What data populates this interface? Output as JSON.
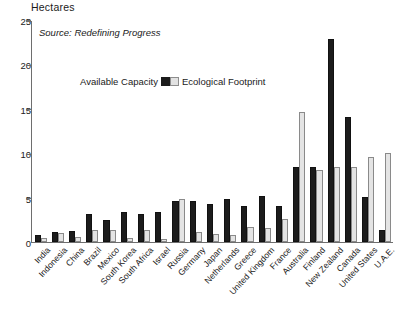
{
  "chart_data": {
    "type": "bar",
    "title": "",
    "subtitle": "",
    "ylabel": "Hectares",
    "xlabel": "",
    "source": "Source: Redefining Progress",
    "ylim": [
      0,
      25
    ],
    "yticks": [
      0,
      5,
      10,
      15,
      20,
      25
    ],
    "ytick_labels": [
      "0",
      "5",
      "10",
      "15",
      "20",
      "25"
    ],
    "grid": false,
    "legend_position": "inside-upper-left",
    "legend": [
      "Available Capacity",
      "Ecological Footprint"
    ],
    "categories": [
      "India",
      "Indonesia",
      "China",
      "Brazil",
      "Mexico",
      "South Korea",
      "South Africa",
      "Israel",
      "Russia",
      "Germany",
      "Japan",
      "Netherlands",
      "Greece",
      "United Kingdom",
      "France",
      "Australia",
      "Finland",
      "New Zealand",
      "Canada",
      "United States",
      "U.A.E."
    ],
    "series": [
      {
        "name": "Ecological Footprint",
        "color": "#1c1c1c",
        "values": [
          0.8,
          1.1,
          1.2,
          3.1,
          2.5,
          3.4,
          3.2,
          3.4,
          4.6,
          4.6,
          4.3,
          4.8,
          4.1,
          5.2,
          4.1,
          8.5,
          8.4,
          22.9,
          14.1,
          5.1,
          1.3
        ]
      },
      {
        "name": "Available Capacity",
        "color": "#e4e4e4",
        "values": [
          0.5,
          1.0,
          0.6,
          1.3,
          1.3,
          0.5,
          1.3,
          0.3,
          4.9,
          1.1,
          0.9,
          0.8,
          1.7,
          1.6,
          2.6,
          14.6,
          8.1,
          8.4,
          8.5,
          9.6,
          10.0
        ]
      }
    ]
  },
  "axis": {
    "y_title": "Hectares"
  }
}
